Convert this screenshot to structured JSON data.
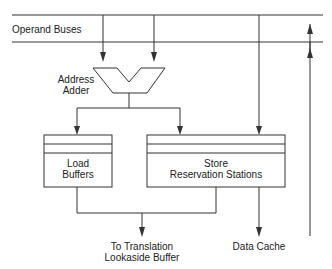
{
  "diagram": {
    "operand_buses_label": "Operand Buses",
    "address_adder_line1": "Address",
    "address_adder_line2": "Adder",
    "load_buffers_line1": "Load",
    "load_buffers_line2": "Buffers",
    "store_line1": "Store",
    "store_line2": "Reservation Stations",
    "tlb_line1": "To Translation",
    "tlb_line2": "Lookaside Buffer",
    "data_cache_label": "Data Cache",
    "stroke_color": "#333333"
  }
}
